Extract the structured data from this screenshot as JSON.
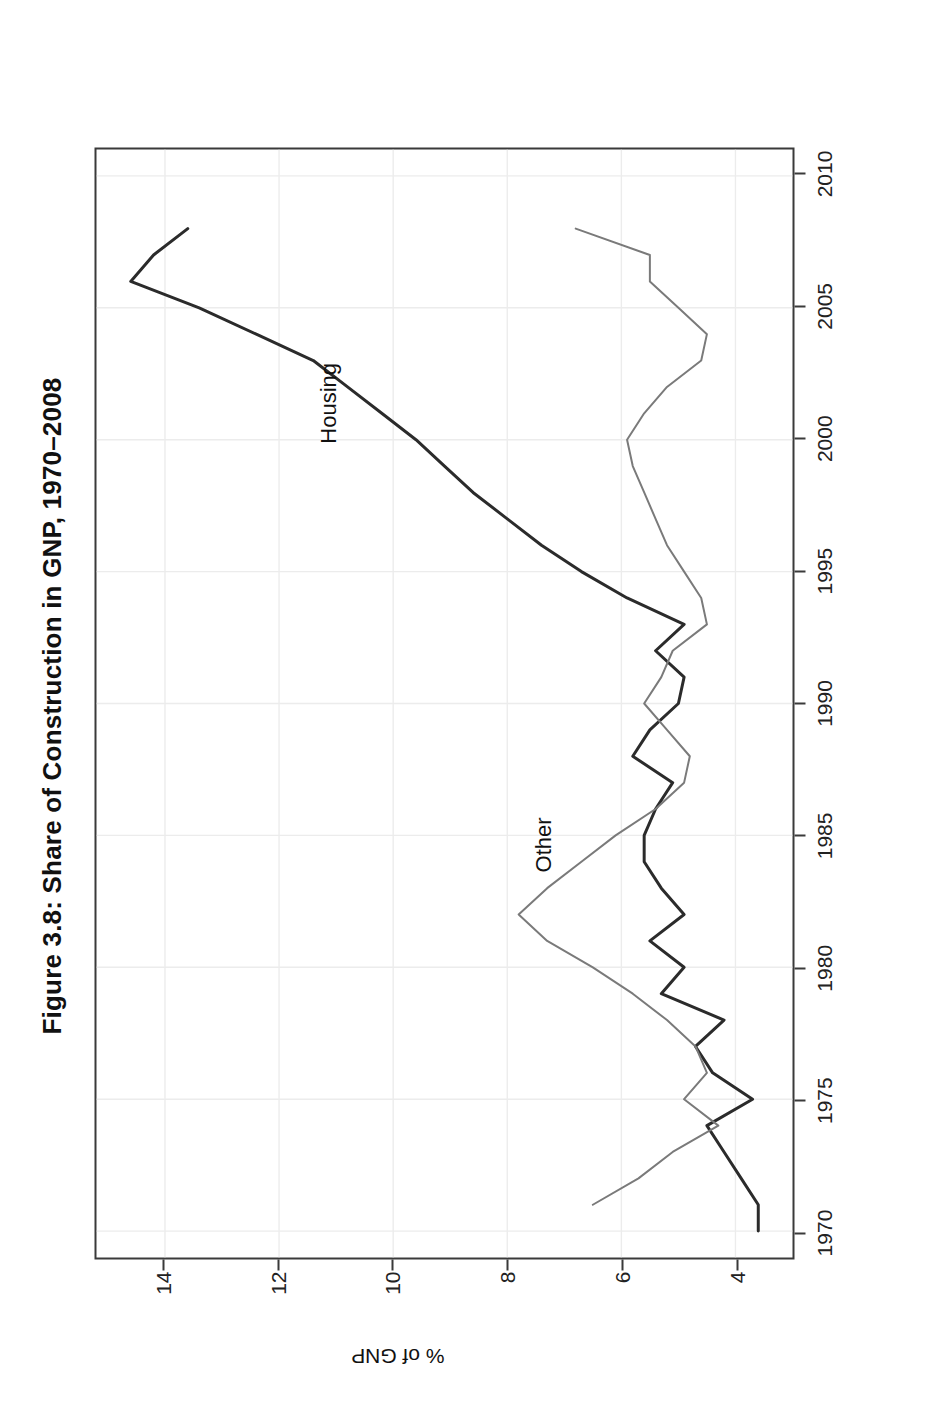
{
  "figure": {
    "title": "Figure 3.8: Share of Construction in GNP, 1970–2008",
    "housing_label": "Housing",
    "other_label": "Other",
    "housing_color": "#2b2b2b",
    "other_color": "#7a7a7a",
    "frame_color": "#3a3a3a",
    "grid_color": "#ececec",
    "background": "#ffffff"
  },
  "chart_data": {
    "type": "line",
    "title": "Figure 3.8: Share of Construction in GNP, 1970–2008",
    "xlabel": "",
    "ylabel": "% of GNP",
    "xlim": [
      1969,
      2011
    ],
    "ylim": [
      3.0,
      15.2
    ],
    "xticks": [
      1970,
      1975,
      1980,
      1985,
      1990,
      1995,
      2000,
      2005,
      2010
    ],
    "yticks": [
      4,
      6,
      8,
      10,
      12,
      14
    ],
    "grid": true,
    "legend": "inline-annotations",
    "x": [
      1970,
      1971,
      1972,
      1973,
      1974,
      1975,
      1976,
      1977,
      1978,
      1979,
      1980,
      1981,
      1982,
      1983,
      1984,
      1985,
      1986,
      1987,
      1988,
      1989,
      1990,
      1991,
      1992,
      1993,
      1994,
      1995,
      1996,
      1997,
      1998,
      1999,
      2000,
      2001,
      2002,
      2003,
      2004,
      2005,
      2006,
      2007,
      2008
    ],
    "series": [
      {
        "name": "Housing",
        "color": "#2b2b2b",
        "values": [
          3.6,
          3.6,
          3.9,
          4.2,
          4.5,
          3.7,
          4.4,
          4.7,
          4.2,
          5.3,
          4.9,
          5.5,
          4.9,
          5.3,
          5.6,
          5.6,
          5.4,
          5.1,
          5.8,
          5.5,
          5.0,
          4.9,
          5.4,
          4.9,
          5.9,
          6.7,
          7.4,
          8.0,
          8.6,
          9.1,
          9.6,
          10.2,
          10.8,
          11.4,
          12.4,
          13.4,
          14.6,
          14.2,
          13.6
        ]
      },
      {
        "name": "Other",
        "color": "#7a7a7a",
        "values": [
          null,
          6.5,
          5.7,
          5.1,
          4.3,
          4.9,
          4.5,
          4.7,
          5.2,
          5.8,
          6.5,
          7.3,
          7.8,
          7.3,
          6.7,
          6.1,
          5.4,
          4.9,
          4.8,
          5.2,
          5.6,
          5.3,
          5.1,
          4.5,
          4.6,
          4.9,
          5.2,
          5.4,
          5.6,
          5.8,
          5.9,
          5.6,
          5.2,
          4.6,
          4.5,
          5.0,
          5.5,
          5.5,
          6.8
        ]
      }
    ]
  },
  "axis": {
    "xtick_labels": [
      "1970",
      "1975",
      "1980",
      "1985",
      "1990",
      "1995",
      "2000",
      "2005",
      "2010"
    ],
    "ytick_labels": [
      "4",
      "6",
      "8",
      "10",
      "12",
      "14"
    ],
    "y_axis_title": "% of GNP"
  }
}
